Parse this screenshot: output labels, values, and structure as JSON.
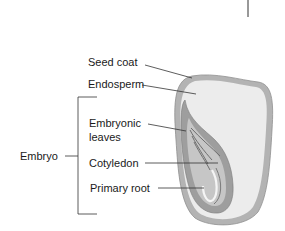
{
  "diagram": {
    "type": "labeled-illustration",
    "labels": {
      "seed_coat": "Seed coat",
      "endosperm": "Endosperm",
      "embryonic_leaves_1": "Embryonic",
      "embryonic_leaves_2": "leaves",
      "cotyledon": "Cotyledon",
      "primary_root": "Primary root",
      "embryo": "Embryo"
    },
    "colors": {
      "seed_coat": "#a9a9a9",
      "endosperm": "#ececec",
      "embryo_outer": "#9a9a9a",
      "embryo_inner": "#c8c8c8",
      "leader_line": "#333333"
    }
  }
}
